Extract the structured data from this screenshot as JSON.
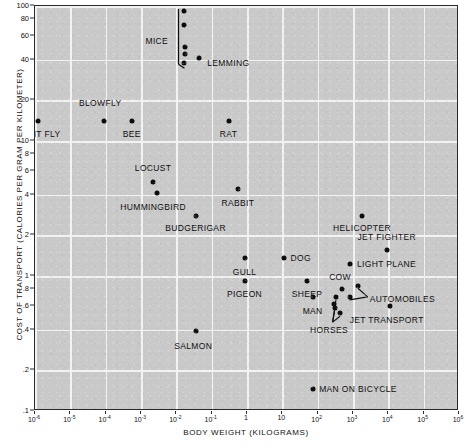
{
  "chart_data": {
    "type": "scatter",
    "title": "",
    "xlabel": "BODY WEIGHT (KILOGRAMS)",
    "ylabel": "COST OF TRANSPORT (CALORIES PER GRAM PER KILOMETER)",
    "xscale": "log",
    "yscale": "log",
    "xlim": [
      1e-06,
      1000000.0
    ],
    "ylim": [
      0.1,
      100
    ],
    "grid": true,
    "legend": "none",
    "xticks": [
      {
        "value": 1e-06,
        "label": "10",
        "exp": "-6"
      },
      {
        "value": 1e-05,
        "label": "10",
        "exp": "-5"
      },
      {
        "value": 0.0001,
        "label": "10",
        "exp": "-4"
      },
      {
        "value": 0.001,
        "label": "10",
        "exp": "-3"
      },
      {
        "value": 0.01,
        "label": "10",
        "exp": "-2"
      },
      {
        "value": 0.1,
        "label": "10",
        "exp": "-1"
      },
      {
        "value": 1,
        "label": "1",
        "exp": ""
      },
      {
        "value": 10,
        "label": "10",
        "exp": ""
      },
      {
        "value": 100,
        "label": "10",
        "exp": "2"
      },
      {
        "value": 1000,
        "label": "10",
        "exp": "3"
      },
      {
        "value": 10000,
        "label": "10",
        "exp": "4"
      },
      {
        "value": 100000,
        "label": "10",
        "exp": "5"
      },
      {
        "value": 1000000,
        "label": "10",
        "exp": "6"
      }
    ],
    "yticks": [
      {
        "value": 100,
        "label": "100"
      },
      {
        "value": 80,
        "label": "80"
      },
      {
        "value": 60,
        "label": "60"
      },
      {
        "value": 40,
        "label": "40"
      },
      {
        "value": 20,
        "label": "20"
      },
      {
        "value": 10,
        "label": "10"
      },
      {
        "value": 8,
        "label": "8"
      },
      {
        "value": 6,
        "label": "6"
      },
      {
        "value": 4,
        "label": "4"
      },
      {
        "value": 2,
        "label": "2"
      },
      {
        "value": 1,
        "label": "1"
      },
      {
        "value": 0.8,
        "label": ".8"
      },
      {
        "value": 0.6,
        "label": ".6"
      },
      {
        "value": 0.4,
        "label": ".4"
      },
      {
        "value": 0.2,
        "label": ".2"
      },
      {
        "value": 0.1,
        "label": ".1"
      }
    ],
    "ygridlines": [
      100,
      40,
      20,
      10,
      4,
      2,
      1,
      0.4,
      0.2,
      0.1
    ],
    "points": [
      {
        "name": "FRUIT FLY",
        "x": 1.2e-06,
        "y": 14.0,
        "label": "FRUIT FLY",
        "lx": 1.2e-06,
        "ly": 11.2,
        "align": "center"
      },
      {
        "name": "BLOWFLY",
        "x": 9e-05,
        "y": 14.0,
        "label": "BLOWFLY",
        "lx": 7e-05,
        "ly": 19.0,
        "align": "center"
      },
      {
        "name": "BEE",
        "x": 0.00055,
        "y": 14.0,
        "label": "BEE",
        "lx": 0.00055,
        "ly": 11.2,
        "align": "center"
      },
      {
        "name": "MICE 1",
        "x": 0.016,
        "y": 92.0,
        "label": "",
        "lx": null,
        "ly": null,
        "align": "center"
      },
      {
        "name": "MICE 2",
        "x": 0.016,
        "y": 72.0,
        "label": "",
        "lx": null,
        "ly": null,
        "align": "center"
      },
      {
        "name": "MICE 3",
        "x": 0.018,
        "y": 50.0,
        "label": "",
        "lx": null,
        "ly": null,
        "align": "center"
      },
      {
        "name": "MICE 4",
        "x": 0.018,
        "y": 44.0,
        "label": "",
        "lx": null,
        "ly": null,
        "align": "center"
      },
      {
        "name": "MICE 5",
        "x": 0.016,
        "y": 38.0,
        "label": "",
        "lx": null,
        "ly": null,
        "align": "center"
      },
      {
        "name": "LEMMING",
        "x": 0.045,
        "y": 41.0,
        "label": "LEMMING",
        "lx": 0.075,
        "ly": 38.0,
        "align": "left"
      },
      {
        "name": "RAT",
        "x": 0.3,
        "y": 14.0,
        "label": "RAT",
        "lx": 0.3,
        "ly": 11.2,
        "align": "center"
      },
      {
        "name": "LOCUST",
        "x": 0.0022,
        "y": 5.0,
        "label": "LOCUST",
        "lx": 0.0022,
        "ly": 6.3,
        "align": "center"
      },
      {
        "name": "HUMMINGBIRD",
        "x": 0.0028,
        "y": 4.1,
        "label": "HUMMINGBIRD",
        "lx": 0.0022,
        "ly": 3.25,
        "align": "center"
      },
      {
        "name": "RABBIT",
        "x": 0.55,
        "y": 4.4,
        "label": "RABBIT",
        "lx": 0.55,
        "ly": 3.5,
        "align": "center"
      },
      {
        "name": "BUDGERIGAR",
        "x": 0.035,
        "y": 2.8,
        "label": "BUDGERIGAR",
        "lx": 0.035,
        "ly": 2.25,
        "align": "center"
      },
      {
        "name": "HELICOPTER",
        "x": 1800,
        "y": 2.8,
        "label": "HELICOPTER",
        "lx": 1800,
        "ly": 2.25,
        "align": "center"
      },
      {
        "name": "JET FIGHTER",
        "x": 9000,
        "y": 1.55,
        "label": "JET FIGHTER",
        "lx": 9000,
        "ly": 1.95,
        "align": "center"
      },
      {
        "name": "GULL",
        "x": 0.85,
        "y": 1.35,
        "label": "GULL",
        "lx": 0.85,
        "ly": 1.07,
        "align": "center"
      },
      {
        "name": "DOG",
        "x": 11.0,
        "y": 1.35,
        "label": "DOG",
        "lx": 17.0,
        "ly": 1.35,
        "align": "left"
      },
      {
        "name": "LIGHT PLANE",
        "x": 800,
        "y": 1.22,
        "label": "LIGHT PLANE",
        "lx": 1300,
        "ly": 1.22,
        "align": "left"
      },
      {
        "name": "PIGEON",
        "x": 0.85,
        "y": 0.92,
        "label": "PIGEON",
        "lx": 0.85,
        "ly": 0.73,
        "align": "center"
      },
      {
        "name": "SHEEP",
        "x": 50.0,
        "y": 0.92,
        "label": "SHEEP",
        "lx": 50.0,
        "ly": 0.73,
        "align": "center"
      },
      {
        "name": "COW",
        "x": 500.0,
        "y": 0.8,
        "label": "COW",
        "lx": 430.0,
        "ly": 0.98,
        "align": "center"
      },
      {
        "name": "MAN",
        "x": 72.0,
        "y": 0.7,
        "label": "MAN",
        "lx": 72.0,
        "ly": 0.55,
        "align": "center"
      },
      {
        "name": "AUTOMOBILE 1",
        "x": 1400,
        "y": 0.85,
        "label": "AUTOMOBILES",
        "lx": 3000,
        "ly": 0.67,
        "align": "left"
      },
      {
        "name": "AUTOMOBILE 2",
        "x": 800,
        "y": 0.7,
        "label": "",
        "lx": null,
        "ly": null,
        "align": "center"
      },
      {
        "name": "HORSE 1",
        "x": 330,
        "y": 0.7,
        "label": "",
        "lx": null,
        "ly": null,
        "align": "center"
      },
      {
        "name": "HORSE 2",
        "x": 300,
        "y": 0.58,
        "label": "",
        "lx": null,
        "ly": null,
        "align": "center"
      },
      {
        "name": "HORSE 3",
        "x": 430,
        "y": 0.53,
        "label": "",
        "lx": null,
        "ly": null,
        "align": "center"
      },
      {
        "name": "HORSES",
        "x": 290,
        "y": 0.62,
        "label": "HORSES",
        "lx": 210,
        "ly": 0.4,
        "align": "center"
      },
      {
        "name": "JET TRANSPORT",
        "x": 11000,
        "y": 0.6,
        "label": "JET TRANSPORT",
        "lx": 9000,
        "ly": 0.47,
        "align": "center"
      },
      {
        "name": "SALMON",
        "x": 0.035,
        "y": 0.39,
        "label": "SALMON",
        "lx": 0.03,
        "ly": 0.305,
        "align": "center"
      },
      {
        "name": "MAN ON BICYCLE",
        "x": 75.0,
        "y": 0.145,
        "label": "MAN ON BICYCLE",
        "lx": 110.0,
        "ly": 0.145,
        "align": "left"
      }
    ],
    "brackets": [
      {
        "name": "MICE",
        "label": "MICE",
        "x": 0.0115,
        "ytop": 95.0,
        "ybottom": 37.0,
        "label_x": 0.0028,
        "label_y": 55.0
      }
    ]
  }
}
